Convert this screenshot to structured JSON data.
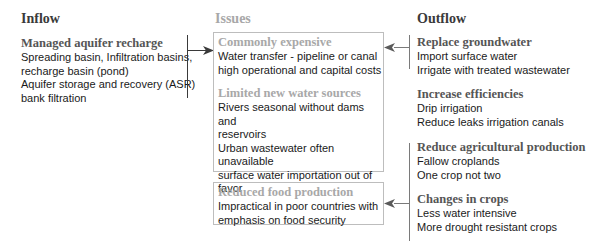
{
  "columns": {
    "inflow": {
      "title": "Inflow",
      "sections": [
        {
          "title": "Managed aquifer recharge",
          "items": [
            "Spreading basin, Infiltration basins,",
            "recharge basin (pond)",
            "Aquifer storage and recovery (ASR)",
            "bank filtration"
          ]
        }
      ]
    },
    "issues": {
      "title": "Issues",
      "boxes": [
        {
          "sections": [
            {
              "title": "Commonly expensive",
              "items": [
                "Water transfer - pipeline or canal",
                "high operational and capital costs"
              ]
            },
            {
              "title": "Limited new water sources",
              "items": [
                "Rivers seasonal without dams and",
                "reservoirs",
                "Urban wastewater often unavailable",
                "surface water importation out of",
                "favor"
              ]
            }
          ]
        },
        {
          "sections": [
            {
              "title": "Reduced food production",
              "items": [
                "Impractical in poor countries with",
                "emphasis on food security"
              ]
            }
          ]
        }
      ]
    },
    "outflow": {
      "title": "Outflow",
      "sections": [
        {
          "title": "Replace groundwater",
          "items": [
            "Import surface water",
            "Irrigate with treated wastewater"
          ]
        },
        {
          "title": "Increase efficiencies",
          "items": [
            "Drip irrigation",
            "Reduce leaks irrigation canals"
          ]
        },
        {
          "title": "Reduce agricultural production",
          "items": [
            "Fallow croplands",
            "One crop not two"
          ]
        },
        {
          "title": "Changes in crops",
          "items": [
            "Less water intensive",
            "More drought resistant crops"
          ]
        }
      ]
    }
  },
  "colors": {
    "heading_dark": "#3a3a3a",
    "heading_grey": "#a8a8a8",
    "section_title": "#555555",
    "box_border": "#bdbdbd",
    "text": "#1a1a1a"
  }
}
